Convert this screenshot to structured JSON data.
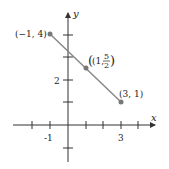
{
  "diagram": {
    "type": "coordinate-plane-line-segment",
    "axes": {
      "x_label": "x",
      "y_label": "y",
      "x_tick_labels": [
        "-1",
        "3"
      ],
      "y_tick_labels": [
        "2"
      ],
      "x_range": [
        -2,
        4
      ],
      "y_range": [
        -1,
        4
      ]
    },
    "segment": {
      "start": {
        "x": -1,
        "y": 4,
        "label": "(−1, 4)"
      },
      "midpoint": {
        "x": 1,
        "y": 2.5,
        "label_prefix": "(1,",
        "frac_num": "5",
        "frac_den": "2",
        "label_suffix": ")"
      },
      "end": {
        "x": 3,
        "y": 1,
        "label": "(3, 1)"
      }
    },
    "colors": {
      "segment": "#888888",
      "points": "#777777",
      "axes": "#333333"
    }
  }
}
